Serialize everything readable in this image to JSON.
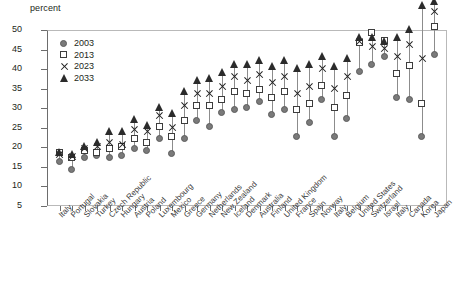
{
  "axis_unit_label": "percent",
  "legend": {
    "position": "top-left-inside",
    "entries": [
      {
        "label": "2003",
        "marker": "circle",
        "color": "#7a7a7a"
      },
      {
        "label": "2013",
        "marker": "square",
        "color": "#ffffff"
      },
      {
        "label": "2023",
        "marker": "x",
        "color": "#1f1f1f"
      },
      {
        "label": "2033",
        "marker": "triangle",
        "color": "#2b2b2b"
      }
    ]
  },
  "chart_data": {
    "type": "scatter",
    "title": "",
    "subtitle": "",
    "xlabel": "",
    "ylabel": "percent",
    "ylim": [
      5,
      50
    ],
    "ytick_step": 5,
    "yticks": [
      5,
      10,
      15,
      20,
      25,
      30,
      35,
      40,
      45,
      50
    ],
    "grid": false,
    "legend_position": "top-left-inside",
    "categories": [
      "Italy",
      "Portugal",
      "Slovakia",
      "Turkey",
      "Czech Republic",
      "Hungary",
      "Austria",
      "Poland",
      "Luxembourg",
      "Mexico",
      "Greece",
      "Germany",
      "Netherlands",
      "New Zealand",
      "Iceland",
      "Denmark",
      "Australia",
      "Finland",
      "United Kingdom",
      "France",
      "Spain",
      "Norway",
      "Italy",
      "Belgium",
      "United States",
      "Switzerland",
      "Israel",
      "Italy",
      "Canada",
      "Korea",
      "Japan"
    ],
    "series": [
      {
        "name": "2003",
        "marker": "circle",
        "values": [
          8.5,
          6.5,
          9.5,
          10.0,
          9.5,
          10.0,
          12.0,
          11.5,
          14.5,
          10.5,
          14.5,
          19.0,
          17.5,
          21.0,
          22.0,
          22.5,
          24.0,
          20.5,
          22.0,
          15.0,
          18.5,
          24.5,
          15.0,
          19.5,
          31.5,
          33.5,
          35.5,
          25.0,
          24.5,
          15.0,
          36.0
        ]
      },
      {
        "name": "2013",
        "marker": "square",
        "values": [
          11.0,
          9.5,
          11.5,
          11.0,
          12.0,
          12.5,
          14.5,
          13.5,
          17.5,
          15.0,
          19.0,
          23.0,
          23.0,
          24.5,
          26.5,
          26.0,
          27.0,
          25.0,
          26.5,
          22.0,
          23.5,
          28.0,
          22.5,
          25.5,
          39.0,
          41.5,
          39.5,
          31.0,
          33.0,
          23.5,
          43.0
        ]
      },
      {
        "name": "2023",
        "marker": "x",
        "values": [
          10.5,
          10.0,
          12.0,
          12.5,
          13.5,
          13.0,
          17.0,
          16.5,
          20.5,
          17.5,
          23.0,
          26.0,
          26.0,
          28.0,
          30.5,
          29.5,
          31.0,
          29.0,
          30.5,
          26.0,
          28.0,
          32.5,
          27.5,
          30.5,
          39.5,
          38.0,
          37.5,
          35.5,
          38.5,
          35.0,
          47.0
        ]
      },
      {
        "name": "2033",
        "marker": "triangle",
        "values": [
          11.0,
          10.5,
          12.5,
          13.5,
          16.5,
          16.5,
          19.5,
          18.0,
          22.5,
          21.0,
          26.5,
          29.5,
          30.0,
          31.5,
          33.5,
          33.5,
          34.5,
          33.0,
          34.5,
          32.5,
          33.5,
          35.5,
          33.0,
          35.0,
          40.5,
          40.5,
          39.5,
          40.5,
          42.5,
          48.5,
          49.5
        ]
      }
    ]
  }
}
